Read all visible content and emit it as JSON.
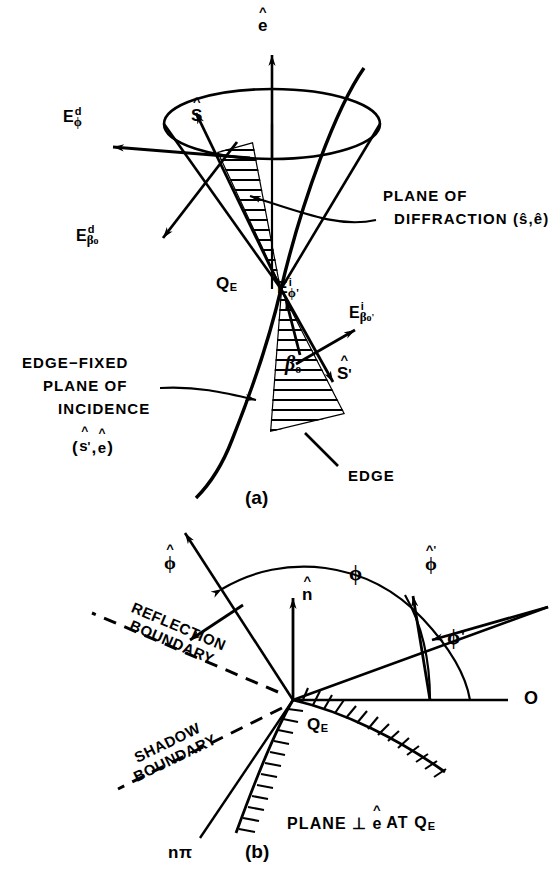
{
  "figure": {
    "panels": [
      {
        "tag": "(a)",
        "caption": "Keller cone of diffracted rays at edge point"
      },
      {
        "tag": "(b)",
        "caption": "Plane perpendicular to the edge at Q_E"
      }
    ]
  },
  "panel_a": {
    "tag": "(a)",
    "vectors": {
      "e_hat": {
        "hat": "^",
        "letter": "e"
      },
      "s_hat": {
        "hat": "^",
        "letter": "S"
      },
      "s_hat_prime": {
        "hat": "^",
        "letter": "S",
        "prime": "'"
      }
    },
    "fields": {
      "E_d_phi": {
        "base": "E",
        "sup": "d",
        "sub": "ϕ"
      },
      "E_d_beta0": {
        "base": "E",
        "sup": "d",
        "sub": "β",
        "subsub": "o"
      },
      "E_i_phi_prime": {
        "base": "E",
        "sup": "i",
        "sub": "ϕ'"
      },
      "E_i_beta0_prime": {
        "base": "E",
        "sup": "i",
        "sub": "β",
        "subsub": "o'"
      }
    },
    "points": {
      "QE": "Q",
      "QE_sub": "E"
    },
    "angles": {
      "beta0": "β",
      "beta0_sub": "o"
    },
    "labels": {
      "plane_of_diffraction_l1": "PLANE OF",
      "plane_of_diffraction_l2": "DIFFRACTION (ŝ,ê)",
      "edge_fixed_l1": "EDGE−FIXED",
      "edge_fixed_l2": "PLANE OF",
      "edge_fixed_l3": "INCIDENCE",
      "edge_fixed_l4_open": "(",
      "edge_fixed_l4_s": "s",
      "edge_fixed_l4_mid": ",",
      "edge_fixed_l4_e": "e",
      "edge_fixed_l4_close": ")",
      "edge": "EDGE"
    }
  },
  "panel_b": {
    "tag": "(b)",
    "vectors": {
      "phi_hat": {
        "hat": "^",
        "letter": "ϕ"
      },
      "n_hat": {
        "hat": "^",
        "letter": "n"
      },
      "phi_hat_prime": {
        "hat": "^",
        "letter": "ϕ",
        "prime": "'"
      }
    },
    "angles": {
      "phi": "ϕ",
      "phi_prime": "ϕ'"
    },
    "labels": {
      "reflection_boundary_l1": "REFLECTION",
      "reflection_boundary_l2": "BOUNDARY",
      "shadow_boundary_l1": "SHADOW",
      "shadow_boundary_l2": "BOUNDARY",
      "o_axis": "O",
      "n_pi": "nπ",
      "plane_perp_pre": "PLANE ⊥",
      "plane_perp_e": "e",
      "plane_perp_post": "AT Q",
      "plane_perp_post_sub": "E",
      "QE": "Q",
      "QE_sub": "E"
    }
  },
  "colors": {
    "ink": "#000000",
    "background": "#ffffff"
  }
}
